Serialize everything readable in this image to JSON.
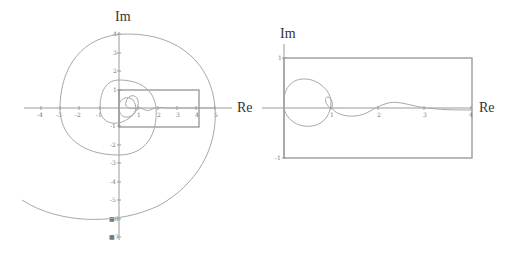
{
  "diagram": {
    "left_panel": {
      "x_axis_label": "Re",
      "y_axis_label": "Im",
      "x_ticks": [
        "-4",
        "-3",
        "-2",
        "-1",
        "1",
        "2",
        "3",
        "4",
        "5"
      ],
      "y_ticks": [
        "4",
        "3",
        "2",
        "1",
        "-1",
        "-2",
        "-3",
        "-4",
        "-5",
        "■6",
        "■7"
      ],
      "zoom_box": {
        "re_min": 0,
        "re_max": 4,
        "im_min": -1,
        "im_max": 1
      }
    },
    "right_panel": {
      "x_axis_label": "Re",
      "y_axis_label": "Im",
      "x_ticks": [
        "1",
        "2",
        "3",
        "4"
      ],
      "y_ticks": [
        "1",
        "-1"
      ],
      "box": {
        "re_min": 0,
        "re_max": 4,
        "im_min": -1,
        "im_max": 1
      }
    },
    "colors": {
      "axis": "#9a9a9a",
      "curve": "#a8a8a8",
      "box": "#8a8a8a",
      "label": "#333333"
    }
  }
}
